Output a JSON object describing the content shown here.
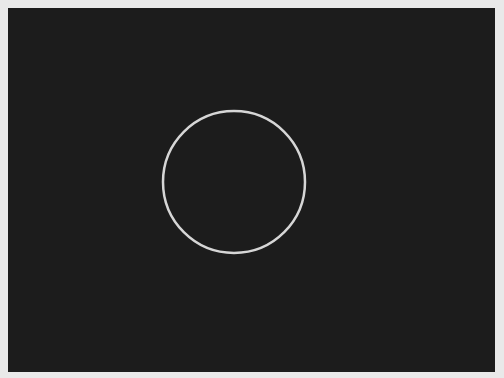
{
  "scene": {
    "background_color": "#e9e9e9",
    "panel_color": "#1c1c1c",
    "shape": {
      "type": "circle",
      "stroke_color": "#d6d6d6",
      "stroke_width": 2.5,
      "cx": 226,
      "cy": 174,
      "r": 71
    }
  }
}
